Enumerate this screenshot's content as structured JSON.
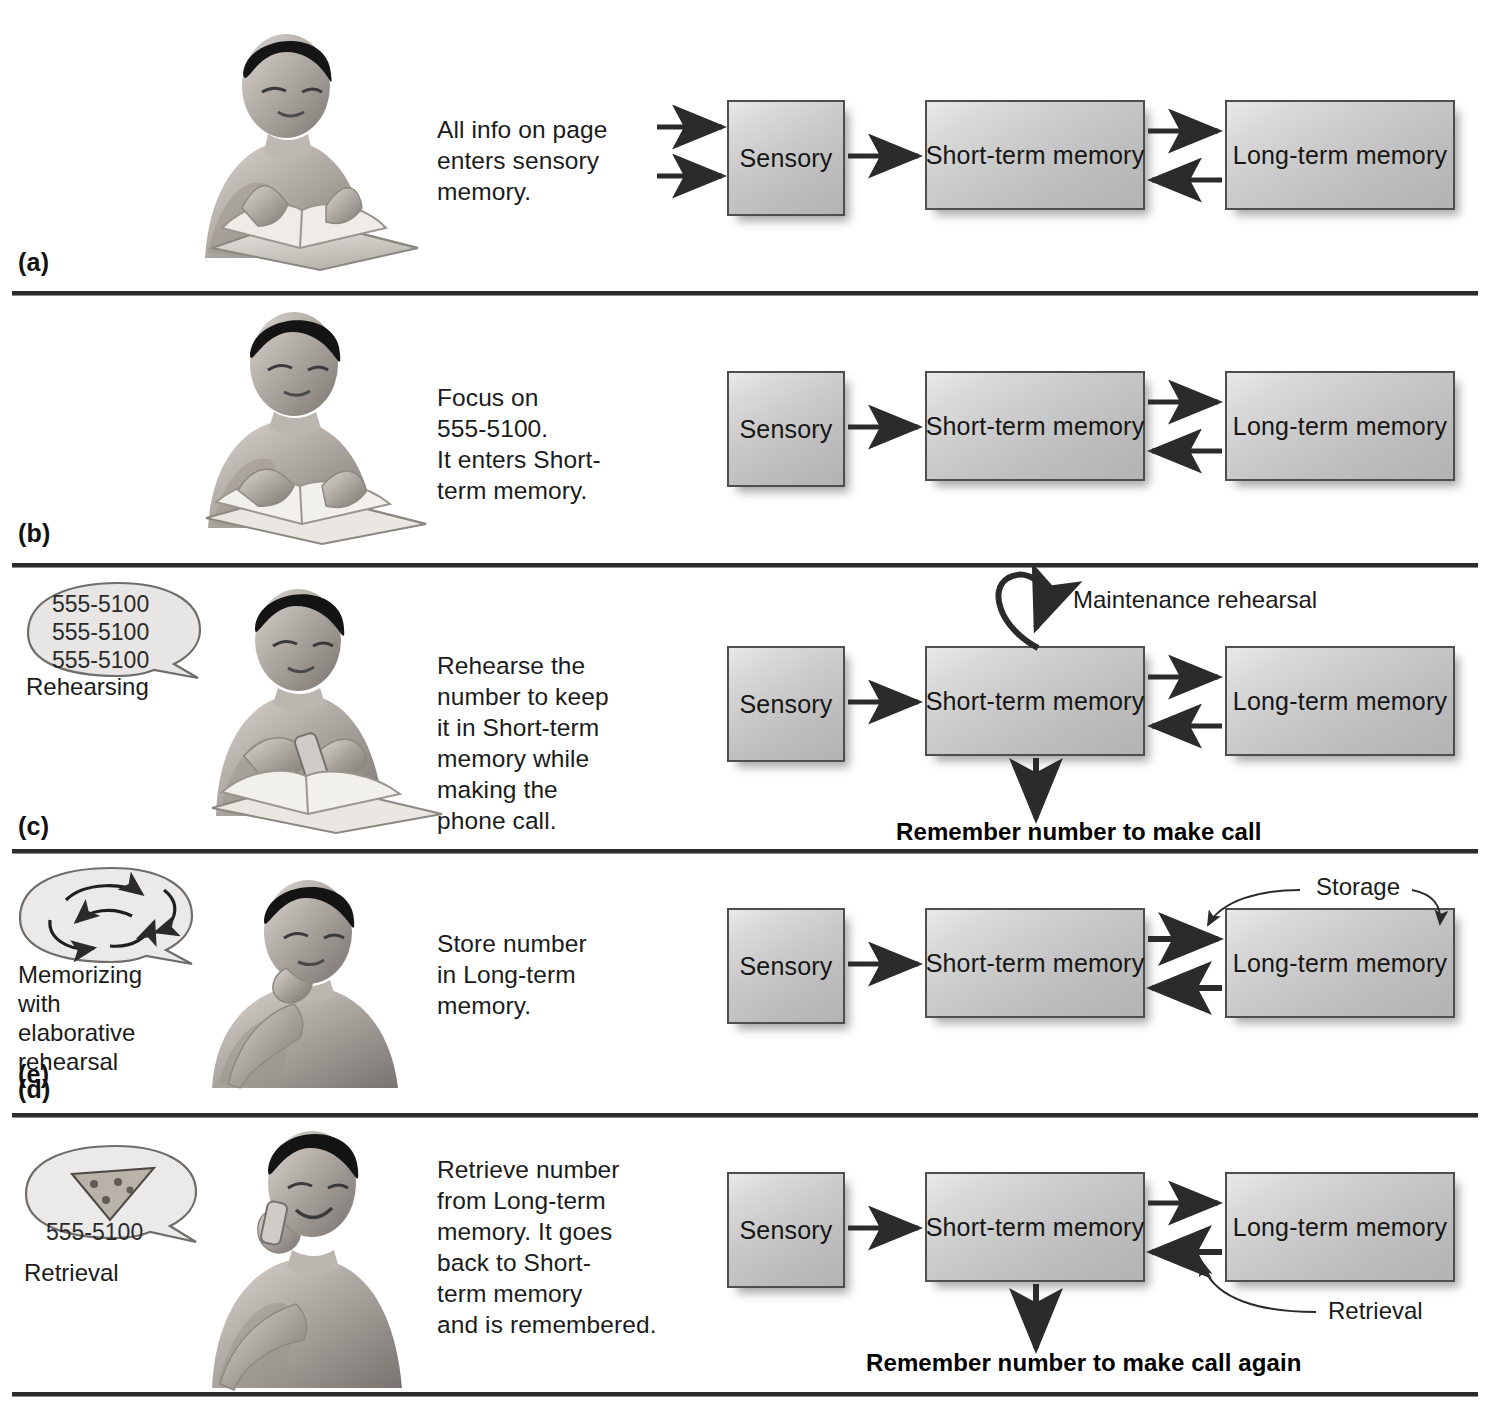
{
  "figure": {
    "type": "information-processing-memory-model",
    "boxes": {
      "sensory": "Sensory",
      "short_term": "Short-term memory",
      "long_term": "Long-term memory"
    },
    "panels": [
      {
        "letter": "(a)",
        "illustration": "person-reading-book-at-desk",
        "bubble": null,
        "bubble_label": null,
        "caption": "All info on page\nenters sensory\nmemory.",
        "boxes": [
          "Sensory",
          "Short-term memory",
          "Long-term memory"
        ],
        "arrows": [
          "input-arrow-top-into-sensory",
          "input-arrow-bottom-into-sensory",
          "sensory-to-short-term",
          "short-term-to-long-term",
          "long-term-to-short-term"
        ],
        "annotations": [],
        "bold_caption": null
      },
      {
        "letter": "(b)",
        "illustration": "person-reading-book-looking-up",
        "bubble": null,
        "bubble_label": null,
        "caption": "Focus on\n555-5100.\nIt enters Short-\nterm memory.",
        "boxes": [
          "Sensory",
          "Short-term memory",
          "Long-term memory"
        ],
        "arrows": [
          "sensory-to-short-term",
          "short-term-to-long-term",
          "long-term-to-short-term"
        ],
        "annotations": [],
        "bold_caption": null
      },
      {
        "letter": "(c)",
        "illustration": "person-holding-phone-with-book",
        "bubble": "555-5100\n555-5100\n555-5100",
        "bubble_label": "Rehearsing",
        "caption": "Rehearse the\nnumber to keep\nit in Short-term\nmemory while\nmaking the\nphone call.",
        "boxes": [
          "Sensory",
          "Short-term memory",
          "Long-term memory"
        ],
        "arrows": [
          "sensory-to-short-term",
          "short-term-to-long-term",
          "long-term-to-short-term",
          "short-term-loop",
          "short-term-down-output"
        ],
        "annotations": [
          "Maintenance rehearsal"
        ],
        "bold_caption": "Remember number to make call"
      },
      {
        "letter": "(d)",
        "illustration": "person-thinking-hand-on-chin",
        "bubble": "swirling-arrows",
        "bubble_label": "Memorizing\nwith\nelaborative\nrehearsal",
        "caption": "Store number\nin Long-term\nmemory.",
        "boxes": [
          "Sensory",
          "Short-term memory",
          "Long-term memory"
        ],
        "arrows": [
          "sensory-to-short-term",
          "short-term-to-long-term",
          "long-term-to-short-term",
          "storage-leader-left",
          "storage-leader-right"
        ],
        "annotations": [
          "Storage"
        ],
        "bold_caption": null
      },
      {
        "letter": "(e)",
        "illustration": "person-smiling-on-phone",
        "bubble": "555-5100",
        "bubble_extra": "pizza-slice-image",
        "bubble_label": "Retrieval",
        "caption": "Retrieve number\nfrom Long-term\nmemory. It goes\nback to  Short-\nterm memory\nand is remembered.",
        "boxes": [
          "Sensory",
          "Short-term memory",
          "Long-term memory"
        ],
        "arrows": [
          "sensory-to-short-term",
          "short-term-to-long-term",
          "long-term-to-short-term",
          "short-term-down-output",
          "retrieval-leader"
        ],
        "annotations": [
          "Retrieval"
        ],
        "bold_caption": "Remember number to make call again"
      }
    ],
    "colors": {
      "box_border": "#4e4e4e",
      "box_fill_light": "#e9e9e9",
      "box_fill_dark": "#b3b3b3",
      "arrow": "#2b2b2b",
      "rule": "#2b2b2b",
      "text": "#1b1b1b"
    }
  }
}
